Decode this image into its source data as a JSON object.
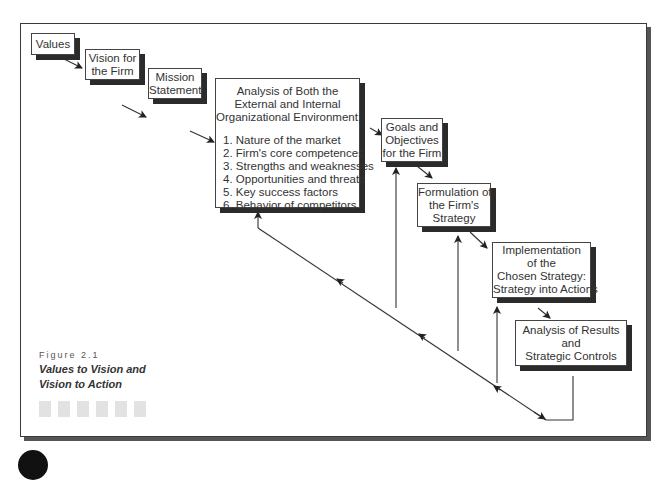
{
  "figure": {
    "number": "Figure 2.1",
    "title_lines": [
      "Values to Vision and",
      "Vision to Action"
    ]
  },
  "boxes": {
    "values": {
      "lines": [
        "Values"
      ]
    },
    "vision": {
      "lines": [
        "Vision for",
        "the Firm"
      ]
    },
    "mission": {
      "lines": [
        "Mission",
        "Statement"
      ]
    },
    "analysis": {
      "lines": [
        "Analysis of Both the",
        "External and Internal",
        "Organizational Environment:"
      ],
      "items": [
        "1. Nature of the market",
        "2. Firm's core competences",
        "3. Strengths and weaknesses",
        "4. Opportunities and threats",
        "5. Key success factors",
        "6. Behavior of competitors"
      ]
    },
    "goals": {
      "lines": [
        "Goals and",
        "Objectives",
        "for the Firm"
      ]
    },
    "formulation": {
      "lines": [
        "Formulation of",
        "the Firm's",
        "Strategy"
      ]
    },
    "implementation": {
      "lines": [
        "Implementation",
        "of the",
        "Chosen Strategy:",
        "Strategy into Actions"
      ]
    },
    "results": {
      "lines": [
        "Analysis of Results",
        "and",
        "Strategic Controls"
      ]
    }
  },
  "decor": {
    "squares_count": 6
  }
}
